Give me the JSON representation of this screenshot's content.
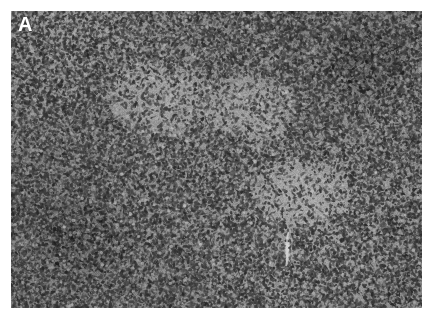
{
  "figure": {
    "panel_label": "A",
    "panel_label_color": "#ffffff",
    "modality": "brightfield-light-microscopy",
    "stain": "hematoxylin-eosin",
    "color_mode": "grayscale",
    "canvas": {
      "width": 434,
      "height": 318,
      "background_color": "#ffffff"
    },
    "plate": {
      "x": 11,
      "y": 11,
      "width": 411,
      "height": 297,
      "mean_tone": "#8d8d8d",
      "darkest_tone": "#242424",
      "lightest_tone": "#d8d8d8"
    },
    "features": [
      {
        "name": "pale-stromal-band",
        "x": 96,
        "y": 52,
        "width": 120,
        "height": 90,
        "tone": "#a3a3a3"
      },
      {
        "name": "pale-stromal-band",
        "x": 196,
        "y": 64,
        "width": 110,
        "height": 86,
        "tone": "#a0a0a0"
      },
      {
        "name": "pale-stromal-band",
        "x": 236,
        "y": 150,
        "width": 130,
        "height": 84,
        "tone": "#9e9e9e"
      },
      {
        "name": "thin-vessel-lumen",
        "x": 284,
        "y": 232,
        "width": 6,
        "height": 34,
        "tone": "#cfcfcf"
      },
      {
        "name": "dark-nuclear-cluster",
        "x": 318,
        "y": 24,
        "width": 96,
        "height": 80,
        "tone": "#6f6f6f"
      },
      {
        "name": "dark-nuclear-cluster",
        "x": 28,
        "y": 196,
        "width": 110,
        "height": 92,
        "tone": "#757575"
      }
    ]
  }
}
